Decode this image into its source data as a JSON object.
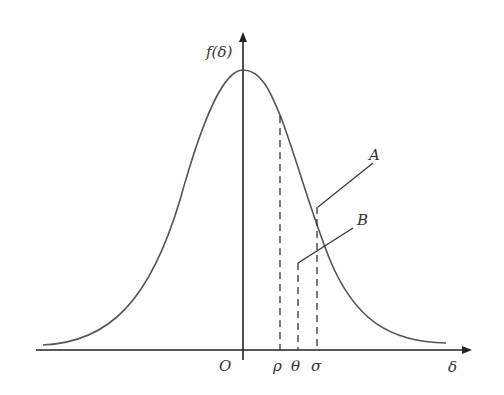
{
  "diagram": {
    "type": "normal-distribution",
    "y_axis_label": "f(δ)",
    "x_axis_label": "δ",
    "origin_label": "O",
    "x_marks": [
      {
        "label": "ρ",
        "x": 280
      },
      {
        "label": "θ",
        "x": 298
      },
      {
        "label": "σ",
        "x": 317
      }
    ],
    "callouts": [
      {
        "label": "A"
      },
      {
        "label": "B"
      }
    ],
    "colors": {
      "curve": "#555555",
      "axis": "#222222"
    }
  }
}
